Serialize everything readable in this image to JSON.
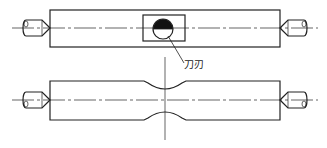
{
  "diagram": {
    "type": "engineering-drawing",
    "colors": {
      "line": "#222222",
      "fill_dark": "#111111",
      "background": "#ffffff"
    },
    "labels": {
      "tool_edge": "刀刃"
    },
    "views": [
      {
        "name": "top-view",
        "description": "bar between two centers with tool window and cutting edge circle"
      },
      {
        "name": "bottom-view",
        "description": "bar between two centers with turned neck groove at middle"
      }
    ]
  }
}
